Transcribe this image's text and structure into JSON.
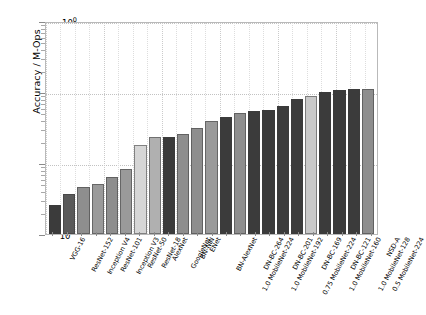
{
  "chart_data": {
    "type": "bar",
    "title": "",
    "xlabel": "",
    "ylabel": "Accuracy / M-Ops",
    "yscale": "log",
    "ylim": [
      0.001,
      1.0
    ],
    "ytick_labels": [
      "10<sup>0</sup>",
      "10<sup>-1</sup>",
      "10<sup>-2</sup>",
      "10<sup>-3</sup>"
    ],
    "ytick_values": [
      1.0,
      0.1,
      0.01,
      0.001
    ],
    "grid": true,
    "legend": "none",
    "categories": [
      "VGG-16",
      "ResNet-152",
      "Inception V4",
      "ResNet-101",
      "Inception V3",
      "ResNet-50",
      "ResNet-18",
      "AlexNet",
      "GoogleNet",
      "BN-NIN",
      "ENet",
      "BN-AlexNet",
      "1.0 MobileNet-224",
      "DN-BC-264",
      "1.0 MobileNet-192",
      "DN-BC-201",
      "0.75 MobileNet-224",
      "DN-BC-169",
      "1.0 MobileNet-160",
      "DN-BC-121",
      "1.0 MobileNet-128",
      "0.5 MobileNet-224",
      "NSD-A"
    ],
    "values": [
      0.0026,
      0.0037,
      0.0046,
      0.0051,
      0.0063,
      0.0082,
      0.018,
      0.023,
      0.0233,
      0.0255,
      0.0315,
      0.0395,
      0.044,
      0.05,
      0.0545,
      0.056,
      0.0635,
      0.081,
      0.089,
      0.1,
      0.108,
      0.109,
      0.111
    ],
    "bar_colors": [
      "#3b3b3b",
      "#5a5a5a",
      "#8e8e8e",
      "#9a9a9a",
      "#8e8e8e",
      "#9a9a9a",
      "#d6d6d6",
      "#b0b0b0",
      "#3b3b3b",
      "#8e8e8e",
      "#8e8e8e",
      "#9a9a9a",
      "#3b3b3b",
      "#8e8e8e",
      "#3b3b3b",
      "#3b3b3b",
      "#3b3b3b",
      "#3b3b3b",
      "#c9c9c9",
      "#3b3b3b",
      "#3b3b3b",
      "#3b3b3b",
      "#8e8e8e"
    ],
    "series_full": {
      "name": "Accuracy per M-Ops",
      "points": [
        {
          "label": "VGG-16",
          "value": 0.0026,
          "color": "#3b3b3b"
        },
        {
          "label": "ResNet-152",
          "value": 0.0037,
          "color": "#5a5a5a"
        },
        {
          "label": "Inception V4",
          "value": 0.0046,
          "color": "#8e8e8e"
        },
        {
          "label": "ResNet-101",
          "value": 0.0051,
          "color": "#9a9a9a"
        },
        {
          "label": "Inception V3",
          "value": 0.0063,
          "color": "#8e8e8e"
        },
        {
          "label": "ResNet-50",
          "value": 0.0082,
          "color": "#9a9a9a"
        },
        {
          "label": "ResNet-18",
          "value": 0.018,
          "color": "#d6d6d6"
        },
        {
          "label": "AlexNet",
          "value": 0.023,
          "color": "#b0b0b0"
        },
        {
          "label": "GoogleNet",
          "value": 0.0233,
          "color": "#3b3b3b"
        },
        {
          "label": "BN-NIN",
          "value": 0.0255,
          "color": "#8e8e8e"
        },
        {
          "label": "ENet",
          "value": 0.0315,
          "color": "#8e8e8e"
        },
        {
          "label": "BN-AlexNet",
          "value": 0.0395,
          "color": "#9a9a9a"
        },
        {
          "label": "1.0 MobileNet-224",
          "value": 0.044,
          "color": "#3b3b3b"
        },
        {
          "label": "DN-BC-264",
          "value": 0.05,
          "color": "#8e8e8e"
        },
        {
          "label": "1.0 MobileNet-192",
          "value": 0.0545,
          "color": "#3b3b3b"
        },
        {
          "label": "DN-BC-201",
          "value": 0.056,
          "color": "#3b3b3b"
        },
        {
          "label": "0.75 MobileNet-224",
          "value": 0.0635,
          "color": "#3b3b3b"
        },
        {
          "label": "DN-BC-169",
          "value": 0.081,
          "color": "#3b3b3b"
        },
        {
          "label": "1.0 MobileNet-160",
          "value": 0.089,
          "color": "#c9c9c9"
        },
        {
          "label": "DN-BC-121",
          "value": 0.1,
          "color": "#3b3b3b"
        },
        {
          "label": "1.0 MobileNet-128",
          "value": 0.108,
          "color": "#3b3b3b"
        },
        {
          "label": "0.5 MobileNet-224",
          "value": 0.109,
          "color": "#3b3b3b"
        },
        {
          "label": "NSD-A",
          "value": 0.111,
          "color": "#8e8e8e"
        }
      ]
    }
  }
}
